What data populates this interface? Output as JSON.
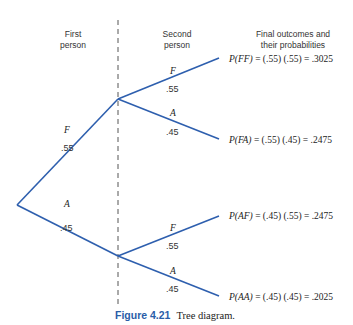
{
  "headers": {
    "first": [
      "First",
      "person"
    ],
    "second": [
      "Second",
      "person"
    ],
    "final": [
      "Final outcomes and",
      "their probabilities"
    ]
  },
  "colors": {
    "branch_line": "#2e5fae",
    "divider": "#555555",
    "caption_accent": "#2a5da8"
  },
  "first_level": [
    {
      "letter": "F",
      "prob": ".55"
    },
    {
      "letter": "A",
      "prob": ".45"
    }
  ],
  "second_level": [
    {
      "letter": "F",
      "prob": ".55"
    },
    {
      "letter": "A",
      "prob": ".45"
    },
    {
      "letter": "F",
      "prob": ".55"
    },
    {
      "letter": "A",
      "prob": ".45"
    }
  ],
  "outcomes": [
    {
      "label": "P(FF)",
      "expr": " = (.55) (.55) = .3025"
    },
    {
      "label": "P(FA)",
      "expr": " = (.55) (.45) = .2475"
    },
    {
      "label": "P(AF)",
      "expr": " = (.45) (.55) = .2475"
    },
    {
      "label": "P(AA)",
      "expr": " = (.45) (.45) = .2025"
    }
  ],
  "caption": {
    "number": "Figure 4.21",
    "text": "Tree diagram."
  }
}
